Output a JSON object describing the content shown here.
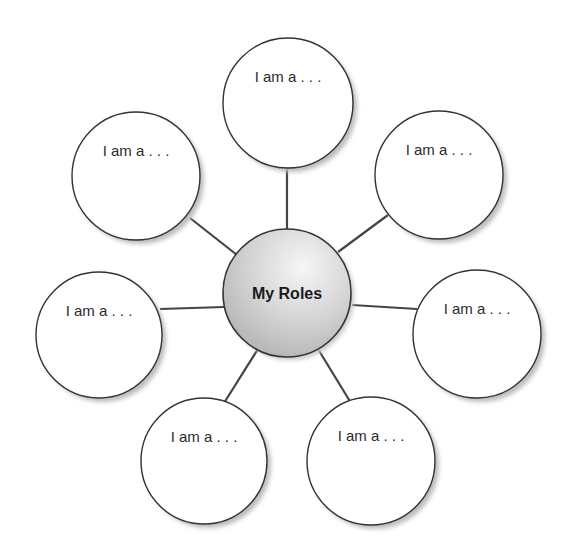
{
  "diagram": {
    "center": {
      "label": "My Roles",
      "cx": 287,
      "cy": 293,
      "r": 64
    },
    "colors": {
      "stroke": "#333333",
      "connector": "#444444",
      "shadow": "#bdbdbd",
      "center_light": "#f4f4f4",
      "center_dark": "#b8b8b8",
      "text": "#2b2b2b"
    },
    "nodes": [
      {
        "id": "top",
        "label": "I am a . . .",
        "cx": 288,
        "cy": 103,
        "r": 65,
        "line": [
          287,
          233,
          287,
          168
        ]
      },
      {
        "id": "upper-left",
        "label": "I am a . . .",
        "cx": 136,
        "cy": 176,
        "r": 64,
        "line": [
          237,
          255,
          190,
          218
        ]
      },
      {
        "id": "upper-right",
        "label": "I am a . . .",
        "cx": 439,
        "cy": 175,
        "r": 64,
        "line": [
          338,
          252,
          388,
          215
        ]
      },
      {
        "id": "left",
        "label": "I am a . . .",
        "cx": 99,
        "cy": 335,
        "r": 63,
        "line": [
          224,
          307,
          160,
          309
        ]
      },
      {
        "id": "right",
        "label": "I am a . . .",
        "cx": 477,
        "cy": 334,
        "r": 64,
        "line": [
          352,
          305,
          417,
          309
        ]
      },
      {
        "id": "bottom-left",
        "label": "I am a . . .",
        "cx": 204,
        "cy": 461,
        "r": 63,
        "line": [
          258,
          349,
          224,
          403
        ]
      },
      {
        "id": "bottom-right",
        "label": "I am a . . .",
        "cx": 371,
        "cy": 461,
        "r": 64,
        "line": [
          318,
          349,
          351,
          403
        ]
      }
    ]
  }
}
